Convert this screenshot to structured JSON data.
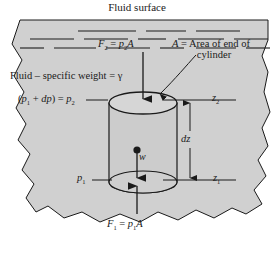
{
  "figure": {
    "title": "Fluid surface",
    "type": "fluid-statics-free-body-diagram",
    "background_color": "#ffffff",
    "fluid_fill_color": "#d0d0d0",
    "line_color": "#1a1a1a"
  },
  "labels": {
    "fluid_surface": "Fluid surface",
    "force_top": "F2 = p2A",
    "area_line1": "A = Area of end of",
    "area_line2": "cylinder",
    "specific_weight": "Fluid – specific weight = γ",
    "pressure_top": "(p1 + dp) = p2",
    "elevation_top": "z2",
    "height_differential": "dz",
    "weight": "w",
    "pressure_bottom": "p1",
    "elevation_bottom": "z1",
    "force_bottom": "F1 = p1A"
  },
  "symbols": {
    "F": "F",
    "p": "p",
    "A": "A",
    "z": "z",
    "d": "d",
    "w": "w",
    "gamma": "γ",
    "equals": "=",
    "plus": "+",
    "dash": "–",
    "sub_1": "1",
    "sub_2": "2",
    "paren_open": "(",
    "paren_close": ")",
    "fluid_word": "Fluid",
    "specific_weight_words": "specific weight",
    "area_words": "Area of end of",
    "cylinder_word": "cylinder"
  },
  "elements": {
    "cylinder": {
      "name": "fluid-element-cylinder",
      "center_x": 143,
      "top_ellipse_y": 103,
      "bottom_ellipse_y": 182,
      "radius_x": 34,
      "radius_y": 11
    },
    "surface_lines_count": 14,
    "arrows": [
      {
        "name": "force-top-arrow",
        "direction": "down",
        "from_y": 52,
        "to_y": 101
      },
      {
        "name": "weight-arrow",
        "direction": "down",
        "from_y": 150,
        "to_y": 180
      },
      {
        "name": "force-bottom-arrow",
        "direction": "up",
        "from_y": 214,
        "to_y": 184
      },
      {
        "name": "dz-arrow-up",
        "direction": "up",
        "from_y": 130,
        "to_y": 103
      },
      {
        "name": "dz-arrow-down",
        "direction": "down",
        "from_y": 148,
        "to_y": 180
      }
    ]
  }
}
